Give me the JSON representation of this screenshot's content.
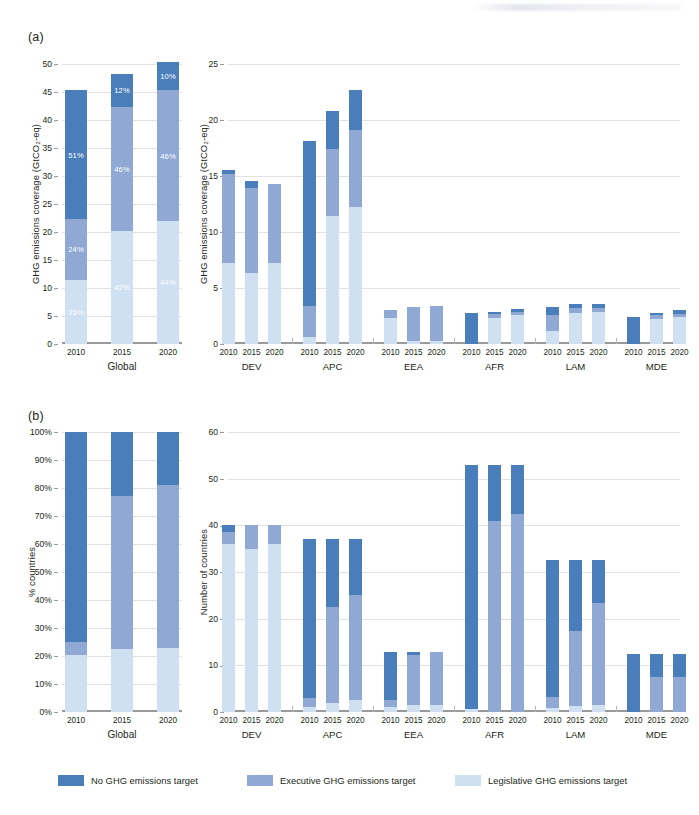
{
  "figure": {
    "panel_a_tag": "(a)",
    "panel_b_tag": "(b)"
  },
  "legend": {
    "items": [
      {
        "label": "No GHG emissions target",
        "color": "#4a7ebb",
        "key": "no_target"
      },
      {
        "label": "Executive GHG emissions target",
        "color": "#8fa8d4",
        "key": "executive"
      },
      {
        "label": "Legislative GHG emissions target",
        "color": "#cfe0f2",
        "key": "legislative"
      }
    ]
  },
  "chart_data": [
    {
      "id": "a-global",
      "panel": "(a)",
      "type": "bar",
      "stacked": true,
      "title": "",
      "xlabel": "Global",
      "ylabel": "GHG emissions coverage (GtCO₂-eq)",
      "categories": [
        "2010",
        "2015",
        "2020"
      ],
      "ylim": [
        0,
        50
      ],
      "yticks": [
        0,
        5,
        10,
        15,
        20,
        25,
        30,
        35,
        40,
        45,
        50
      ],
      "ytick_labels": [
        "0",
        "5",
        "10",
        "15",
        "20",
        "25",
        "30",
        "35",
        "40",
        "45",
        "50"
      ],
      "grid": true,
      "series": [
        {
          "name": "Legislative GHG emissions target",
          "color": "#cfe0f2",
          "values": [
            11.5,
            20.2,
            22.0
          ]
        },
        {
          "name": "Executive GHG emissions target",
          "color": "#8fa8d4",
          "values": [
            10.8,
            22.2,
            23.3
          ]
        },
        {
          "name": "No GHG emissions target",
          "color": "#4a7ebb",
          "values": [
            23.0,
            5.8,
            5.0
          ]
        }
      ],
      "data_labels": [
        {
          "series": "Legislative GHG emissions target",
          "category": "2010",
          "text": "25%"
        },
        {
          "series": "Executive GHG emissions target",
          "category": "2010",
          "text": "24%"
        },
        {
          "series": "No GHG emissions target",
          "category": "2010",
          "text": "51%"
        },
        {
          "series": "Legislative GHG emissions target",
          "category": "2015",
          "text": "42%"
        },
        {
          "series": "Executive GHG emissions target",
          "category": "2015",
          "text": "46%"
        },
        {
          "series": "No GHG emissions target",
          "category": "2015",
          "text": "12%"
        },
        {
          "series": "Legislative GHG emissions target",
          "category": "2020",
          "text": "44%"
        },
        {
          "series": "Executive GHG emissions target",
          "category": "2020",
          "text": "46%"
        },
        {
          "series": "No GHG emissions target",
          "category": "2020",
          "text": "10%"
        }
      ]
    },
    {
      "id": "a-regions",
      "panel": "(a)",
      "type": "bar",
      "stacked": true,
      "grouped": true,
      "title": "",
      "xlabel": "",
      "ylabel": "GHG emissions coverage (GtCO₂-eq)",
      "groups": [
        "DEV",
        "APC",
        "EEA",
        "AFR",
        "LAM",
        "MDE"
      ],
      "categories": [
        "2010",
        "2015",
        "2020"
      ],
      "ylim": [
        0,
        25
      ],
      "yticks": [
        0,
        5,
        10,
        15,
        20,
        25
      ],
      "ytick_labels": [
        "0",
        "5",
        "10",
        "15",
        "20",
        "25"
      ],
      "grid": true,
      "series": [
        {
          "name": "Legislative GHG emissions target",
          "color": "#cfe0f2",
          "values": {
            "DEV": [
              7.2,
              6.3,
              7.2
            ],
            "APC": [
              0.6,
              11.4,
              12.2
            ],
            "EEA": [
              2.3,
              0.25,
              0.3
            ],
            "AFR": [
              0.0,
              2.35,
              2.55
            ],
            "LAM": [
              1.15,
              2.8,
              2.85
            ],
            "MDE": [
              0.0,
              2.25,
              2.4
            ]
          }
        },
        {
          "name": "Executive GHG emissions target",
          "color": "#8fa8d4",
          "values": {
            "DEV": [
              8.0,
              7.6,
              7.1
            ],
            "APC": [
              2.8,
              6.0,
              6.9
            ],
            "EEA": [
              0.75,
              3.05,
              3.1
            ],
            "AFR": [
              0.0,
              0.35,
              0.3
            ],
            "LAM": [
              1.45,
              0.45,
              0.4
            ],
            "MDE": [
              0.0,
              0.3,
              0.3
            ]
          }
        },
        {
          "name": "No GHG emissions target",
          "color": "#4a7ebb",
          "values": {
            "DEV": [
              0.3,
              0.7,
              0.0
            ],
            "APC": [
              14.7,
              3.4,
              3.6
            ],
            "EEA": [
              0.0,
              0.0,
              0.0
            ],
            "AFR": [
              2.75,
              0.2,
              0.25
            ],
            "LAM": [
              0.75,
              0.3,
              0.3
            ],
            "MDE": [
              2.4,
              0.25,
              0.3
            ]
          }
        }
      ]
    },
    {
      "id": "b-global",
      "panel": "(b)",
      "type": "bar",
      "stacked": true,
      "title": "",
      "xlabel": "Global",
      "ylabel": "% countries",
      "categories": [
        "2010",
        "2015",
        "2020"
      ],
      "ylim": [
        0,
        100
      ],
      "yticks": [
        0,
        10,
        20,
        30,
        40,
        50,
        60,
        70,
        80,
        90,
        100
      ],
      "ytick_labels": [
        "0%",
        "10%",
        "20%",
        "30%",
        "40%",
        "50%",
        "60%",
        "70%",
        "80%",
        "90%",
        "100%"
      ],
      "grid": true,
      "series": [
        {
          "name": "Legislative GHG emissions target",
          "color": "#cfe0f2",
          "values": [
            20.5,
            22.5,
            23.0
          ]
        },
        {
          "name": "Executive GHG emissions target",
          "color": "#8fa8d4",
          "values": [
            4.5,
            54.5,
            58.0
          ]
        },
        {
          "name": "No GHG emissions target",
          "color": "#4a7ebb",
          "values": [
            75.0,
            23.0,
            19.0
          ]
        }
      ]
    },
    {
      "id": "b-regions",
      "panel": "(b)",
      "type": "bar",
      "stacked": true,
      "grouped": true,
      "title": "",
      "xlabel": "",
      "ylabel": "Number of countries",
      "groups": [
        "DEV",
        "APC",
        "EEA",
        "AFR",
        "LAM",
        "MDE"
      ],
      "categories": [
        "2010",
        "2015",
        "2020"
      ],
      "ylim": [
        0,
        60
      ],
      "yticks": [
        0,
        10,
        20,
        30,
        40,
        50,
        60
      ],
      "ytick_labels": [
        "0",
        "10",
        "20",
        "30",
        "40",
        "50",
        "60"
      ],
      "grid": true,
      "series": [
        {
          "name": "Legislative GHG emissions target",
          "color": "#cfe0f2",
          "values": {
            "DEV": [
              36.0,
              35.0,
              36.0
            ],
            "APC": [
              1.0,
              2.0,
              2.5
            ],
            "EEA": [
              1.0,
              1.6,
              1.6
            ],
            "AFR": [
              0.6,
              0.0,
              0.0
            ],
            "LAM": [
              0.8,
              1.3,
              1.4
            ],
            "MDE": [
              0.0,
              0.0,
              0.0
            ]
          }
        },
        {
          "name": "Executive GHG emissions target",
          "color": "#8fa8d4",
          "values": {
            "DEV": [
              2.5,
              5.0,
              4.0
            ],
            "APC": [
              2.0,
              20.5,
              22.5
            ],
            "EEA": [
              1.5,
              10.6,
              11.2
            ],
            "AFR": [
              0.0,
              41.0,
              42.5
            ],
            "LAM": [
              2.4,
              16.0,
              22.0
            ],
            "MDE": [
              0.0,
              7.5,
              7.5
            ]
          }
        },
        {
          "name": "No GHG emissions target",
          "color": "#4a7ebb",
          "values": {
            "DEV": [
              1.5,
              0.0,
              0.0
            ],
            "APC": [
              34.0,
              14.5,
              12.0
            ],
            "EEA": [
              10.3,
              0.6,
              0.0
            ],
            "AFR": [
              52.4,
              12.0,
              10.5
            ],
            "LAM": [
              29.3,
              15.2,
              9.1
            ],
            "MDE": [
              12.5,
              5.0,
              5.0
            ]
          }
        }
      ]
    }
  ]
}
